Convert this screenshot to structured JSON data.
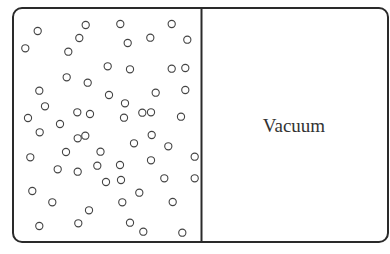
{
  "diagram": {
    "type": "gas-expansion-container",
    "left_chamber": {
      "contents": "gas-molecules",
      "molecule_count": 64,
      "molecules": [
        [
          37.7,
          31
        ],
        [
          25.3,
          48.3
        ],
        [
          85.7,
          25
        ],
        [
          79.3,
          38
        ],
        [
          68.3,
          51.7
        ],
        [
          120.3,
          24
        ],
        [
          127.7,
          43
        ],
        [
          150.3,
          37.7
        ],
        [
          171.7,
          24
        ],
        [
          187.3,
          39.7
        ],
        [
          66.7,
          77.3
        ],
        [
          87.7,
          82.7
        ],
        [
          39.3,
          90.7
        ],
        [
          45,
          106.3
        ],
        [
          77.3,
          112.3
        ],
        [
          90,
          114
        ],
        [
          107.7,
          66.3
        ],
        [
          130,
          69.3
        ],
        [
          171.7,
          68.7
        ],
        [
          185.3,
          68
        ],
        [
          109,
          95
        ],
        [
          155.7,
          92.7
        ],
        [
          185.3,
          90
        ],
        [
          125,
          103.3
        ],
        [
          142.3,
          112.7
        ],
        [
          151,
          112.3
        ],
        [
          124,
          117.7
        ],
        [
          181,
          116.7
        ],
        [
          39.7,
          132.3
        ],
        [
          77.7,
          138.3
        ],
        [
          85.3,
          135.7
        ],
        [
          30.3,
          157.3
        ],
        [
          100.5,
          151.7
        ],
        [
          57.7,
          169.3
        ],
        [
          77.7,
          171.7
        ],
        [
          97.3,
          165.7
        ],
        [
          134,
          143.3
        ],
        [
          151.7,
          135
        ],
        [
          168.3,
          146.3
        ],
        [
          151,
          160.3
        ],
        [
          194.7,
          156.7
        ],
        [
          32.3,
          191
        ],
        [
          52.3,
          202.3
        ],
        [
          89,
          210.3
        ],
        [
          39.3,
          226
        ],
        [
          78.3,
          223.3
        ],
        [
          121,
          180
        ],
        [
          164.3,
          178.3
        ],
        [
          194.7,
          178.3
        ],
        [
          139.3,
          192.7
        ],
        [
          122.3,
          202.3
        ],
        [
          172.7,
          202
        ],
        [
          130,
          222.7
        ],
        [
          143.3,
          231.7
        ],
        [
          182.3,
          232.7
        ],
        [
          66,
          152
        ],
        [
          28,
          118
        ],
        [
          60,
          124
        ],
        [
          120,
          165
        ],
        [
          106,
          182
        ]
      ]
    },
    "right_chamber": {
      "label": "Vacuum"
    },
    "colors": {
      "stroke": "#2a2a2a",
      "molecule": "#444444",
      "text": "#333333",
      "background": "#ffffff"
    }
  }
}
